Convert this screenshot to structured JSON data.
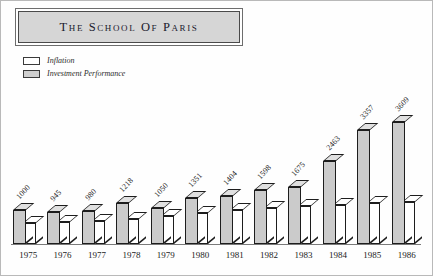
{
  "title": {
    "text": "The School of Paris"
  },
  "legend": {
    "items": [
      {
        "label": "Inflation",
        "swatch": "white",
        "color": "#ffffff"
      },
      {
        "label": "Investment Performance",
        "swatch": "gray",
        "color": "#cbcbcb"
      }
    ]
  },
  "chart_data": {
    "type": "bar",
    "title": "The School of Paris",
    "xlabel": "",
    "ylabel": "",
    "grid": false,
    "legend_position": "top-left",
    "categories": [
      "1975",
      "1976",
      "1977",
      "1978",
      "1979",
      "1980",
      "1981",
      "1982",
      "1983",
      "1984",
      "1985",
      "1986"
    ],
    "series": [
      {
        "name": "Investment Performance",
        "color": "#cbcbcb",
        "values": [
          1000,
          945,
          980,
          1218,
          1050,
          1351,
          1404,
          1598,
          1675,
          2463,
          3357,
          3609
        ],
        "labels": [
          "1000",
          "945",
          "980",
          "1218",
          "1050",
          "1351",
          "1404",
          "1598",
          "1675",
          "2463",
          "3357",
          "3609"
        ]
      },
      {
        "name": "Inflation",
        "color": "#ffffff",
        "values": [
          1000,
          1044,
          1110,
          1190,
          1320,
          1490,
          1640,
          1740,
          1800,
          1880,
          1940,
          1980
        ],
        "labels": [
          "",
          "",
          "",
          "",
          "",
          "",
          "",
          "",
          "",
          "",
          "",
          ""
        ]
      }
    ],
    "ylim": [
      0,
      3900
    ]
  }
}
